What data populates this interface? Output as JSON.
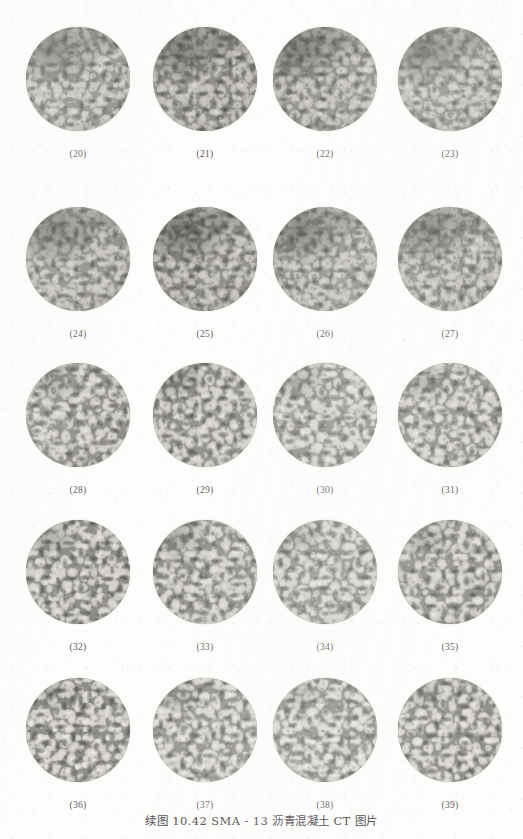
{
  "page": {
    "background_color": "#fdfdfc",
    "caption": "续图 10.42  SMA - 13 沥青混凝土 CT 图片"
  },
  "figure": {
    "columns": 4,
    "rows": 5,
    "image_kind": "ct-slice-circular-grayscale",
    "specimen": "SMA-13 asphalt concrete",
    "cells": [
      {
        "label": "(20)",
        "col": 0,
        "row": 0,
        "tone": "dark"
      },
      {
        "label": "(21)",
        "col": 1,
        "row": 0,
        "tone": "dark"
      },
      {
        "label": "(22)",
        "col": 2,
        "row": 0,
        "tone": "dark"
      },
      {
        "label": "(23)",
        "col": 3,
        "row": 0,
        "tone": "dark"
      },
      {
        "label": "(24)",
        "col": 0,
        "row": 1,
        "tone": "dark"
      },
      {
        "label": "(25)",
        "col": 1,
        "row": 1,
        "tone": "dark"
      },
      {
        "label": "(26)",
        "col": 2,
        "row": 1,
        "tone": "dark"
      },
      {
        "label": "(27)",
        "col": 3,
        "row": 1,
        "tone": "dark"
      },
      {
        "label": "(28)",
        "col": 0,
        "row": 2,
        "tone": "light"
      },
      {
        "label": "(29)",
        "col": 1,
        "row": 2,
        "tone": "light"
      },
      {
        "label": "(30)",
        "col": 2,
        "row": 2,
        "tone": "light"
      },
      {
        "label": "(31)",
        "col": 3,
        "row": 2,
        "tone": "light"
      },
      {
        "label": "(32)",
        "col": 0,
        "row": 3,
        "tone": "light"
      },
      {
        "label": "(33)",
        "col": 1,
        "row": 3,
        "tone": "light"
      },
      {
        "label": "(34)",
        "col": 2,
        "row": 3,
        "tone": "light"
      },
      {
        "label": "(35)",
        "col": 3,
        "row": 3,
        "tone": "light"
      },
      {
        "label": "(36)",
        "col": 0,
        "row": 4,
        "tone": "lightest"
      },
      {
        "label": "(37)",
        "col": 1,
        "row": 4,
        "tone": "lightest"
      },
      {
        "label": "(38)",
        "col": 2,
        "row": 4,
        "tone": "lightest"
      },
      {
        "label": "(39)",
        "col": 3,
        "row": 4,
        "tone": "lightest"
      }
    ]
  }
}
